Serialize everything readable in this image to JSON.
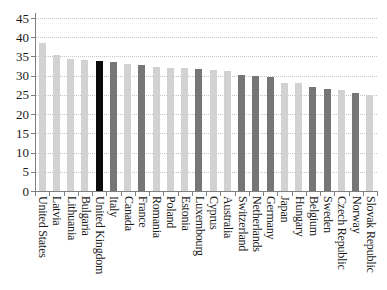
{
  "chart_data": {
    "type": "bar",
    "title": "",
    "xlabel": "",
    "ylabel": "",
    "categories": [
      "United States",
      "Latvia",
      "Lithuania",
      "Bulgaria",
      "United Kingdom",
      "Italy",
      "Canada",
      "France",
      "Romania",
      "Poland",
      "Estonia",
      "Luxembourg",
      "Cyprus",
      "Australia",
      "Switzerland",
      "Netherlands",
      "Germany",
      "Japan",
      "Hungary",
      "Belgium",
      "Sweden",
      "Czech Republic",
      "Norway",
      "Slovak Republic"
    ],
    "values": [
      38.6,
      35.5,
      34.3,
      34.2,
      33.9,
      33.6,
      33.0,
      32.7,
      32.2,
      32.1,
      32.0,
      31.7,
      31.6,
      31.3,
      30.3,
      29.8,
      29.7,
      28.2,
      28.0,
      27.1,
      26.6,
      26.3,
      25.4,
      25.1
    ],
    "bar_shades": [
      "light",
      "light",
      "light",
      "light",
      "black",
      "dark",
      "light",
      "dark",
      "light",
      "light",
      "light",
      "dark",
      "light",
      "light",
      "dark",
      "dark",
      "dark",
      "light",
      "light",
      "dark",
      "dark",
      "light",
      "dark",
      "light"
    ],
    "palette": {
      "light": "#d2d2d2",
      "dark": "#767676",
      "black": "#0a0a0a"
    },
    "ylim": [
      0,
      45
    ],
    "ytick_step": 5,
    "ytick_labels": [
      "0",
      "5",
      "10",
      "15",
      "20",
      "25",
      "30",
      "35",
      "40",
      "45"
    ],
    "grid": "horizontal-dotted",
    "legend": "none",
    "x_label_rotation_deg": 90,
    "axis_color": "#808080",
    "gridline_color": "#c6c6c6",
    "text_color": "#1a1a1a",
    "background_color": "#ffffff"
  }
}
